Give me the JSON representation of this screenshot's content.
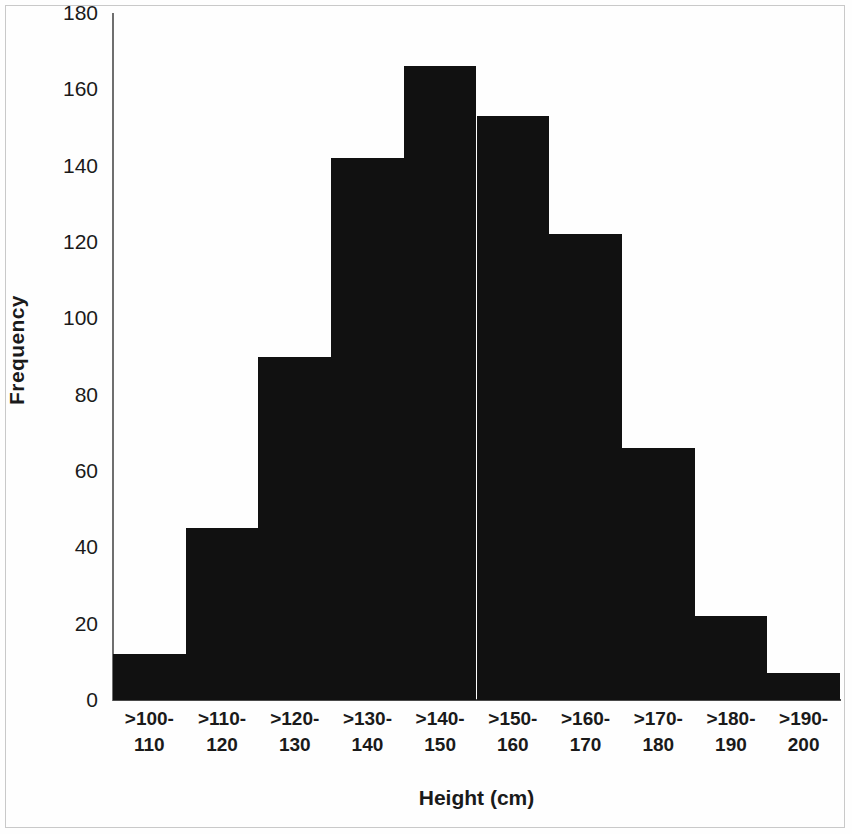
{
  "chart_data": {
    "type": "bar",
    "title": "",
    "subtitle": "",
    "xlabel": "Height (cm)",
    "ylabel": "Frequency",
    "categories": [
      ">100-110",
      ">110-120",
      ">120-130",
      ">130-140",
      ">140-150",
      ">150-160",
      ">160-170",
      ">170-180",
      ">180-190",
      ">190-200"
    ],
    "category_lines": [
      [
        ">100-",
        "110"
      ],
      [
        ">110-",
        "120"
      ],
      [
        ">120-",
        "130"
      ],
      [
        ">130-",
        "140"
      ],
      [
        ">140-",
        "150"
      ],
      [
        ">150-",
        "160"
      ],
      [
        ">160-",
        "170"
      ],
      [
        ">170-",
        "180"
      ],
      [
        ">180-",
        "190"
      ],
      [
        ">190-",
        "200"
      ]
    ],
    "values": [
      12,
      45,
      90,
      142,
      166,
      153,
      122,
      66,
      22,
      7
    ],
    "ylim": [
      0,
      180
    ],
    "ytick_values": [
      0,
      20,
      40,
      60,
      80,
      100,
      120,
      140,
      160,
      180
    ],
    "ytick_labels": [
      "0",
      "20",
      "40",
      "60",
      "80",
      "100",
      "120",
      "140",
      "160",
      "180"
    ],
    "grid": false,
    "legend": false,
    "legend_position": "none",
    "bar_gap": 0,
    "bar_color": "#111111",
    "axis_color": "#4a4a4a",
    "background_color": "#ffffff",
    "text_color": "#1a1a1a"
  }
}
